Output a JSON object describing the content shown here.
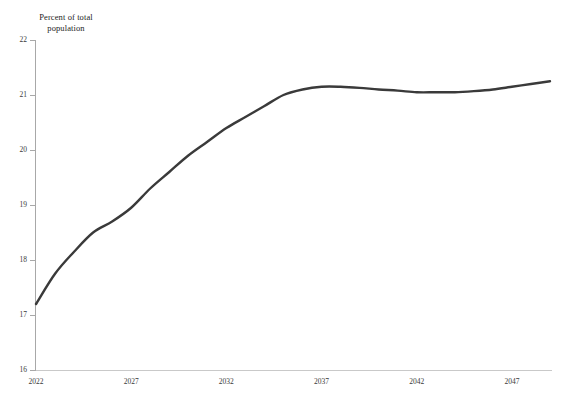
{
  "chart_data": {
    "type": "line",
    "title": "",
    "subtitle": "",
    "xlabel": "",
    "ylabel": "Percent of total population",
    "ylabel_lines": [
      "Percent of total",
      "population"
    ],
    "xlim": [
      2022,
      2049
    ],
    "ylim": [
      16,
      22
    ],
    "grid": false,
    "legend": false,
    "legend_position": "none",
    "y_ticks": [
      22,
      21,
      20,
      19,
      18,
      17,
      16
    ],
    "y_tick_labels": [
      "22",
      "21",
      "20",
      "19",
      "18",
      "17",
      "16"
    ],
    "x_ticks": [
      2022,
      2027,
      2032,
      2037,
      2042,
      2047
    ],
    "x_tick_labels": [
      "2022",
      "2027",
      "2032",
      "2037",
      "2042",
      "2047"
    ],
    "series": [
      {
        "name": "Percent of total population",
        "color": "#3a3a3a",
        "x": [
          2022,
          2023,
          2024,
          2025,
          2026,
          2027,
          2028,
          2029,
          2030,
          2031,
          2032,
          2033,
          2034,
          2035,
          2036,
          2037,
          2038,
          2039,
          2040,
          2041,
          2042,
          2043,
          2044,
          2045,
          2046,
          2047,
          2048,
          2049
        ],
        "values": [
          17.2,
          17.75,
          18.15,
          18.5,
          18.7,
          18.95,
          19.3,
          19.6,
          19.9,
          20.15,
          20.4,
          20.6,
          20.8,
          21.0,
          21.1,
          21.15,
          21.15,
          21.13,
          21.1,
          21.08,
          21.05,
          21.05,
          21.05,
          21.07,
          21.1,
          21.15,
          21.2,
          21.25
        ]
      }
    ]
  },
  "colors": {
    "series_line": "#3a3a3a",
    "axis": "#a8a8a8",
    "axis_x": "#c9c9c9",
    "tick_text": "#3a3a3a",
    "title_text": "#1c1c1c",
    "background": "#ffffff"
  }
}
